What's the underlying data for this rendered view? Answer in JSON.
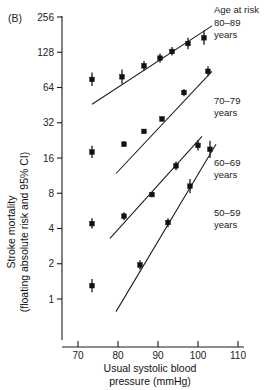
{
  "panel_label": "(B)",
  "axes": {
    "y_title_line1": "Stroke mortality",
    "y_title_line2": "(floating absolute risk and 95% CI)",
    "x_title_line1": "Usual systolic blood",
    "x_title_line2": "pressure (mmHg)",
    "y_ticks": [
      "256",
      "128",
      "64",
      "32",
      "16",
      "8",
      "4",
      "2",
      "1"
    ],
    "x_ticks": [
      "70",
      "80",
      "90",
      "100",
      "110"
    ]
  },
  "legend": {
    "title": "Age at risk",
    "items": [
      {
        "range": "80–89",
        "unit": "years"
      },
      {
        "range": "70–79",
        "unit": "years"
      },
      {
        "range": "60–69",
        "unit": "years"
      },
      {
        "range": "50–59",
        "unit": "years"
      }
    ]
  },
  "chart_data": {
    "type": "scatter",
    "xlabel": "Usual systolic blood pressure (mmHg)",
    "ylabel": "Stroke mortality (floating absolute risk and 95% CI)",
    "yscale": "log2",
    "ylim": [
      0.7,
      256
    ],
    "xlim": [
      66,
      112
    ],
    "grid": false,
    "legend_position": "right",
    "y_tick_values": [
      256,
      128,
      64,
      32,
      16,
      8,
      4,
      2,
      1
    ],
    "x_tick_values": [
      70,
      80,
      90,
      100,
      110
    ],
    "series": [
      {
        "name": "80–89 years",
        "marker": "square-with-error-bar",
        "fit_line": {
          "x_start": 73.5,
          "y_start": 46,
          "x_end": 103.5,
          "y_end": 215
        },
        "points": [
          {
            "x": 73.5,
            "y": 75,
            "ci_low": 66,
            "ci_high": 86
          },
          {
            "x": 81.0,
            "y": 79,
            "ci_low": 69,
            "ci_high": 91
          },
          {
            "x": 86.5,
            "y": 98,
            "ci_low": 89,
            "ci_high": 108
          },
          {
            "x": 90.5,
            "y": 114,
            "ci_low": 104,
            "ci_high": 125
          },
          {
            "x": 93.5,
            "y": 130,
            "ci_low": 120,
            "ci_high": 142
          },
          {
            "x": 97.5,
            "y": 152,
            "ci_low": 136,
            "ci_high": 170
          },
          {
            "x": 101.5,
            "y": 170,
            "ci_low": 148,
            "ci_high": 196
          }
        ]
      },
      {
        "name": "70–79 years",
        "marker": "square-with-error-bar",
        "fit_line": {
          "x_start": 79.5,
          "y_start": 11.8,
          "x_end": 103.5,
          "y_end": 88
        },
        "points": [
          {
            "x": 73.5,
            "y": 18.0,
            "ci_low": 16.0,
            "ci_high": 20.4
          },
          {
            "x": 81.5,
            "y": 21.0,
            "ci_low": 20.0,
            "ci_high": 22.2
          },
          {
            "x": 86.5,
            "y": 27.0,
            "ci_low": 26.0,
            "ci_high": 28.2
          },
          {
            "x": 91.0,
            "y": 34.5,
            "ci_low": 33.0,
            "ci_high": 36.0
          },
          {
            "x": 96.5,
            "y": 58.0,
            "ci_low": 54.0,
            "ci_high": 62.0
          },
          {
            "x": 102.5,
            "y": 88.0,
            "ci_low": 80.0,
            "ci_high": 97.0
          }
        ]
      },
      {
        "name": "60–69 years",
        "marker": "square-with-error-bar",
        "fit_line": {
          "x_start": 78.0,
          "y_start": 3.3,
          "x_end": 101.0,
          "y_end": 24.5
        },
        "points": [
          {
            "x": 73.5,
            "y": 4.4,
            "ci_low": 4.0,
            "ci_high": 4.9
          },
          {
            "x": 81.5,
            "y": 5.1,
            "ci_low": 4.7,
            "ci_high": 5.5
          },
          {
            "x": 88.5,
            "y": 7.8,
            "ci_low": 7.4,
            "ci_high": 8.2
          },
          {
            "x": 94.5,
            "y": 13.7,
            "ci_low": 12.6,
            "ci_high": 14.9
          },
          {
            "x": 100.0,
            "y": 20.5,
            "ci_low": 18.5,
            "ci_high": 22.8
          }
        ]
      },
      {
        "name": "50–59 years",
        "marker": "square-with-error-bar",
        "fit_line": {
          "x_start": 79.5,
          "y_start": 0.78,
          "x_end": 104.5,
          "y_end": 21.0
        },
        "points": [
          {
            "x": 73.5,
            "y": 1.3,
            "ci_low": 1.14,
            "ci_high": 1.48
          },
          {
            "x": 85.5,
            "y": 1.95,
            "ci_low": 1.78,
            "ci_high": 2.14
          },
          {
            "x": 92.5,
            "y": 4.5,
            "ci_low": 4.1,
            "ci_high": 4.9
          },
          {
            "x": 98.0,
            "y": 9.2,
            "ci_low": 8.0,
            "ci_high": 10.6
          },
          {
            "x": 103.0,
            "y": 19.0,
            "ci_low": 16.0,
            "ci_high": 22.5
          }
        ]
      }
    ]
  }
}
